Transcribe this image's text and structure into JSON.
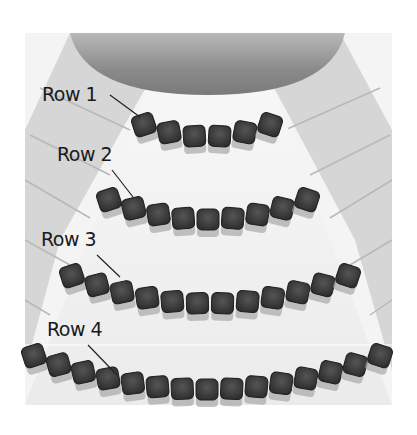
{
  "diagram": {
    "colors": {
      "background": "#ffffff",
      "floor_center": "#f2f2f2",
      "side_sections": "#d4d4d4",
      "stage": "#8a8a8a",
      "seat": "#3c3c3c",
      "seat_shadow": "#9a9a9a"
    },
    "rows": [
      {
        "label": "Row 1",
        "seats": 6
      },
      {
        "label": "Row 2",
        "seats": 9
      },
      {
        "label": "Row 3",
        "seats": 12
      },
      {
        "label": "Row 4",
        "seats": 15
      }
    ]
  }
}
